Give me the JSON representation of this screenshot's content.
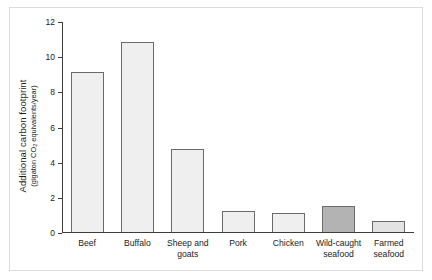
{
  "chart_data": {
    "type": "bar",
    "title": "",
    "xlabel": "",
    "ylabel": "Additional carbon footprint",
    "ylabel_units": "(gigaton CO2 equivalents/year)",
    "ylabel_units_parts": {
      "before": "(gigaton CO",
      "subscript": "2",
      "after": " equivalents/year)"
    },
    "ylim": [
      0,
      12
    ],
    "yticks": [
      0,
      2,
      4,
      6,
      8,
      10,
      12
    ],
    "ytick_labels": [
      "0",
      "2",
      "4",
      "6",
      "8",
      "10",
      "12"
    ],
    "grid": false,
    "legend": "none",
    "categories": [
      [
        "Beef"
      ],
      [
        "Buffalo"
      ],
      [
        "Sheep and",
        "goats"
      ],
      [
        "Pork"
      ],
      [
        "Chicken"
      ],
      [
        "Wild-caught",
        "seafood"
      ],
      [
        "Farmed",
        "seafood"
      ]
    ],
    "values": [
      9.1,
      10.8,
      4.7,
      1.2,
      1.1,
      1.5,
      0.6
    ],
    "bar_colors": [
      "#efefef",
      "#efefef",
      "#efefef",
      "#efefef",
      "#efefef",
      "#b3b3b3",
      "#e3e3e3"
    ],
    "bar_edge_color": "#6b6b6b",
    "axis_color": "#3d3d3d",
    "frame_color": "#dcdcdc",
    "background": "#ffffff"
  }
}
